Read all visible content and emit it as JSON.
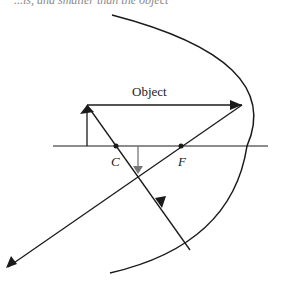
{
  "caption": "...is, and smaller than the object",
  "labels": {
    "object": "Object",
    "center": "C",
    "focus": "F"
  },
  "colors": {
    "line": "#1a1a1a",
    "image_arrow": "#777777"
  }
}
